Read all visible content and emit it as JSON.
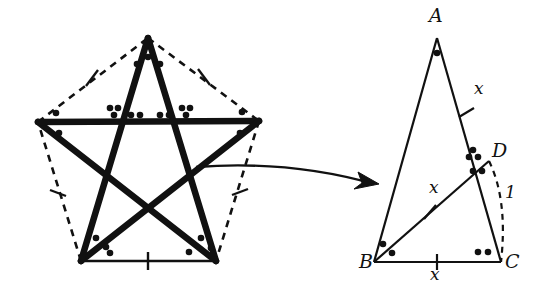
{
  "figure": {
    "background_color": "#ffffff",
    "stroke_color": "#111111",
    "width": 549,
    "height": 296
  },
  "pentagram": {
    "name": "regular-pentagram-inscribed-in-pentagon",
    "pentagon_style": "dashed",
    "star_style": "solid-thick",
    "base_style": "solid-thin",
    "vertices": [
      {
        "name": "top",
        "x": 148,
        "y": 38
      },
      {
        "name": "right",
        "x": 259,
        "y": 121
      },
      {
        "name": "bottom-right",
        "x": 216,
        "y": 261
      },
      {
        "name": "bottom-left",
        "x": 81,
        "y": 261
      },
      {
        "name": "left",
        "x": 38,
        "y": 122
      }
    ],
    "tick_marks": [
      {
        "name": "tick-upper-left-edge",
        "x": 92,
        "y": 78,
        "angle": 40
      },
      {
        "name": "tick-upper-right-edge",
        "x": 204,
        "y": 77,
        "angle": -40
      },
      {
        "name": "tick-lower-left-edge",
        "x": 58,
        "y": 193,
        "angle": -72
      },
      {
        "name": "tick-lower-right-edge",
        "x": 240,
        "y": 192,
        "angle": 72
      },
      {
        "name": "tick-base-edge",
        "x": 148,
        "y": 261,
        "angle": 0
      }
    ],
    "angle_marks": {
      "single_dot_label": "one-dot-angle",
      "double_dot_label": "two-dot-angle",
      "triple_dot_label": "three-dot-angle"
    }
  },
  "arrow": {
    "name": "callout-arrow",
    "from_x": 196,
    "from_y": 167,
    "to_x": 379,
    "to_y": 183,
    "description": "curved arrow pointing from star to enlarged triangle"
  },
  "triangle": {
    "name": "triangle-ABD-C",
    "vertices": [
      {
        "label": "A",
        "x": 437,
        "y": 38,
        "label_x": 430,
        "label_y": 8
      },
      {
        "label": "B",
        "x": 374,
        "y": 262,
        "label_x": 362,
        "label_y": 261
      },
      {
        "label": "C",
        "x": 501,
        "y": 262,
        "label_x": 506,
        "label_y": 261
      },
      {
        "label": "D",
        "x": 487,
        "y": 162,
        "label_x": 494,
        "label_y": 145
      }
    ],
    "segment_labels": [
      {
        "name": "label-x-on-AC",
        "text": "x",
        "x": 479,
        "y": 88
      },
      {
        "name": "label-x-on-BD",
        "text": "x",
        "x": 434,
        "y": 187
      },
      {
        "name": "label-x-on-BC",
        "text": "x",
        "x": 434,
        "y": 272
      },
      {
        "name": "label-one-on-DC-arc",
        "text": "1",
        "x": 508,
        "y": 192
      }
    ],
    "tick_marks": [
      {
        "name": "tick-on-AC",
        "x": 466,
        "y": 112,
        "angle": 72
      },
      {
        "name": "tick-on-BD",
        "x": 430,
        "y": 212,
        "angle": 38
      },
      {
        "name": "tick-on-BC",
        "x": 437,
        "y": 262,
        "angle": 0
      }
    ],
    "arc": {
      "name": "dashed-arc-DC",
      "style": "dashed"
    }
  }
}
